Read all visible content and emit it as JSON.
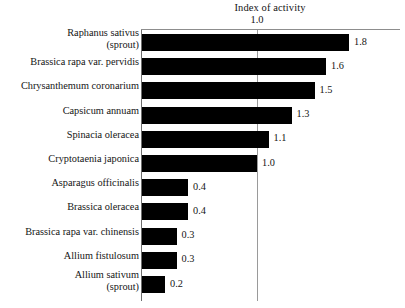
{
  "chart_data": {
    "type": "bar",
    "orientation": "horizontal",
    "title": "Index of activity",
    "xlabel": "",
    "ylabel": "",
    "xlim": [
      0,
      2.24
    ],
    "grid": true,
    "gridlines": [
      1.0
    ],
    "tick_labels": [
      "1.0"
    ],
    "legend": null,
    "categories": [
      "Raphanus sativus\n(sprout)",
      "Brassica rapa var. pervidis",
      "Chrysanthemum coronarium",
      "Capsicum annuam",
      "Spinacia oleracea",
      "Cryptotaenia japonica",
      "Asparagus officinalis",
      "Brassica oleracea",
      "Brassica rapa var. chinensis",
      "Allium fistulosum",
      "Allium sativum\n(sprout)"
    ],
    "values": [
      1.8,
      1.6,
      1.5,
      1.3,
      1.1,
      1.0,
      0.4,
      0.4,
      0.3,
      0.3,
      0.2
    ],
    "value_labels": [
      "1.8",
      "1.6",
      "1.5",
      "1.3",
      "1.1",
      "1.0",
      "0.4",
      "0.4",
      "0.3",
      "0.3",
      "0.2"
    ],
    "bar_color": "#000000",
    "background_color": "#ffffff",
    "axis_color": "#6e6e6e",
    "gridline_color": "#9a9a9a"
  }
}
